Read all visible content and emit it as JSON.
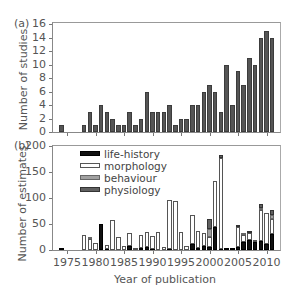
{
  "chart_data": [
    {
      "panel": "(a)",
      "type": "bar",
      "title": "",
      "xlabel": "",
      "ylabel": "Number of studies",
      "ylim": [
        0,
        16
      ],
      "yticks": [
        0,
        2,
        4,
        6,
        8,
        10,
        12,
        14,
        16
      ],
      "x": [
        1974,
        1975,
        1976,
        1977,
        1978,
        1979,
        1980,
        1981,
        1982,
        1983,
        1984,
        1985,
        1986,
        1987,
        1988,
        1989,
        1990,
        1991,
        1992,
        1993,
        1994,
        1995,
        1996,
        1997,
        1998,
        1999,
        2000,
        2001,
        2002,
        2003,
        2004,
        2005,
        2006,
        2007,
        2008,
        2009,
        2010,
        2011
      ],
      "values": [
        1,
        0,
        0,
        0,
        1,
        3,
        1,
        4,
        3,
        2,
        1,
        1,
        3,
        1,
        2,
        6,
        3,
        3,
        3,
        4,
        1,
        2,
        2,
        4,
        4,
        6,
        7,
        6,
        3,
        10,
        4,
        9,
        7,
        11,
        10,
        14,
        15,
        14
      ],
      "color": "#555555",
      "grid": false
    },
    {
      "panel": "(b)",
      "type": "bar",
      "stacked": true,
      "title": "",
      "xlabel": "Year of publication",
      "ylabel": "Number of estimates",
      "ylim": [
        0,
        200
      ],
      "yticks": [
        0,
        50,
        100,
        150,
        200
      ],
      "xticks": [
        1975,
        1980,
        1985,
        1990,
        1995,
        2000,
        2005,
        2010
      ],
      "x": [
        1974,
        1975,
        1976,
        1977,
        1978,
        1979,
        1980,
        1981,
        1982,
        1983,
        1984,
        1985,
        1986,
        1987,
        1988,
        1989,
        1990,
        1991,
        1992,
        1993,
        1994,
        1995,
        1996,
        1997,
        1998,
        1999,
        2000,
        2001,
        2002,
        2003,
        2004,
        2005,
        2006,
        2007,
        2008,
        2009,
        2010,
        2011
      ],
      "series": [
        {
          "name": "life-history",
          "color": "#111111",
          "values": [
            1,
            0,
            0,
            0,
            0,
            0,
            0,
            50,
            2,
            0,
            0,
            0,
            8,
            0,
            3,
            6,
            2,
            0,
            0,
            2,
            0,
            0,
            0,
            12,
            3,
            8,
            5,
            45,
            2,
            2,
            2,
            5,
            15,
            20,
            15,
            18,
            12,
            30
          ]
        },
        {
          "name": "morphology",
          "color": "#ffffff",
          "values": [
            0,
            0,
            0,
            0,
            28,
            22,
            13,
            0,
            8,
            58,
            25,
            8,
            25,
            3,
            25,
            28,
            25,
            35,
            5,
            95,
            95,
            35,
            8,
            55,
            33,
            25,
            20,
            88,
            175,
            0,
            0,
            40,
            13,
            12,
            5,
            58,
            60,
            30
          ]
        },
        {
          "name": "behaviour",
          "color": "#a0a0a0",
          "values": [
            0,
            0,
            0,
            0,
            0,
            2,
            0,
            0,
            0,
            0,
            0,
            0,
            0,
            0,
            0,
            0,
            0,
            0,
            0,
            0,
            0,
            0,
            0,
            0,
            0,
            0,
            15,
            0,
            0,
            0,
            0,
            0,
            2,
            0,
            0,
            5,
            0,
            8
          ]
        },
        {
          "name": "physiology",
          "color": "#606060",
          "values": [
            0,
            0,
            0,
            0,
            0,
            0,
            0,
            0,
            0,
            0,
            0,
            0,
            0,
            0,
            0,
            0,
            0,
            0,
            0,
            0,
            0,
            0,
            0,
            0,
            0,
            0,
            20,
            0,
            5,
            0,
            0,
            3,
            0,
            5,
            0,
            8,
            0,
            8
          ]
        }
      ],
      "legend_position": "upper left",
      "grid": false
    }
  ],
  "labels": {
    "panel_a": "(a)",
    "panel_b": "(b)",
    "ylabel_a": "Number of studies",
    "ylabel_b": "Number of estimates",
    "xlabel": "Year of publication",
    "legend": [
      "life-history",
      "morphology",
      "behaviour",
      "physiology"
    ]
  }
}
